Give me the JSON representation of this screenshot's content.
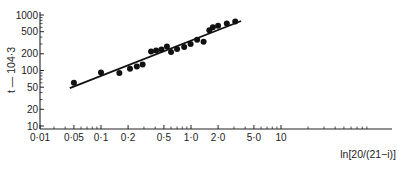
{
  "chart_data": {
    "type": "scatter",
    "title": "",
    "xlabel": "ln[20/(21−i)]",
    "ylabel": "t — 104·3",
    "xscale": "log",
    "yscale": "log",
    "xlim": [
      0.01,
      30
    ],
    "ylim": [
      10,
      1000
    ],
    "grid": false,
    "legend": null,
    "x_tick_labels": [
      "0·01",
      "0·05",
      "0·1",
      "0·2",
      "0·5",
      "1·0",
      "2·0",
      "5·0",
      "10"
    ],
    "x_tick_values": [
      0.01,
      0.05,
      0.1,
      0.2,
      0.5,
      1.0,
      2.0,
      5.0,
      10
    ],
    "y_tick_labels": [
      "10",
      "20",
      "50",
      "100",
      "200",
      "500",
      "1000"
    ],
    "y_tick_values": [
      10,
      20,
      50,
      100,
      200,
      500,
      1000
    ],
    "series": [
      {
        "name": "observations",
        "type": "scatter",
        "x": [
          0.05,
          0.1,
          0.16,
          0.21,
          0.25,
          0.29,
          0.36,
          0.41,
          0.47,
          0.54,
          0.6,
          0.7,
          0.84,
          0.99,
          1.17,
          1.38,
          1.6,
          1.75,
          2.0,
          2.5,
          3.1
        ],
        "y": [
          60,
          92,
          90,
          108,
          118,
          128,
          220,
          230,
          240,
          270,
          215,
          245,
          265,
          300,
          360,
          330,
          530,
          600,
          640,
          700,
          760
        ]
      },
      {
        "name": "fitted line",
        "type": "line",
        "x": [
          0.045,
          3.6
        ],
        "y": [
          48,
          780
        ]
      }
    ]
  }
}
